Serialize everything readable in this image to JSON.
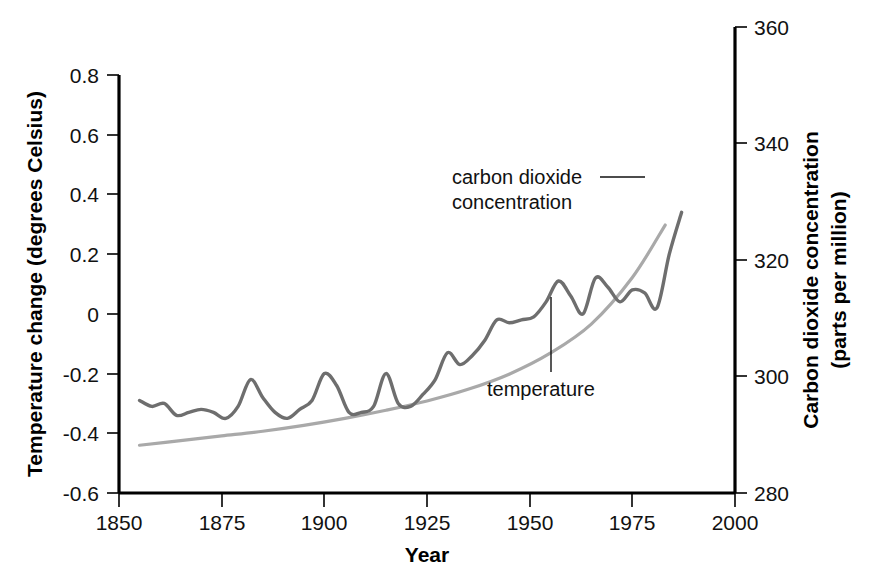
{
  "chart_data": {
    "type": "line",
    "title": "",
    "subtitle": "",
    "xlabel": "Year",
    "ylabel": "Temperature change (degrees Celsius)",
    "y2label": "Carbon dioxide concentration (parts per million)",
    "ylabel_line1": "Temperature change (degrees Celsius)",
    "y2label_line1": "Carbon dioxide concentration",
    "y2label_line2": "(parts per million)",
    "grid": false,
    "legend_position": "inline-annotations",
    "xlim": [
      1850,
      2000
    ],
    "ylim": [
      -0.6,
      0.8
    ],
    "y2lim": [
      280,
      360
    ],
    "xticks": [
      1850,
      1875,
      1900,
      1925,
      1950,
      1975,
      2000
    ],
    "xtick_labels": [
      "1850",
      "1875",
      "1900",
      "1925",
      "1950",
      "1975",
      "2000"
    ],
    "yticks": [
      -0.6,
      -0.4,
      -0.2,
      0,
      0.2,
      0.4,
      0.6,
      0.8
    ],
    "ytick_labels": [
      "-0.6",
      "-0.4",
      "-0.2",
      "0",
      "0.2",
      "0.4",
      "0.6",
      "0.8"
    ],
    "y2ticks": [
      280,
      300,
      320,
      340,
      360
    ],
    "y2tick_labels": [
      "280",
      "300",
      "320",
      "340",
      "360"
    ],
    "annotations": [
      {
        "id": "co2-annotation",
        "text_line1": "carbon dioxide",
        "text_line2": "concentration",
        "text": "carbon dioxide concentration",
        "x": 1889,
        "y": 0.46
      },
      {
        "id": "temperature-annotation",
        "text": "temperature",
        "x": 1937,
        "y": -0.24
      }
    ],
    "series": [
      {
        "name": "temperature",
        "axis": "left",
        "units": "degrees Celsius",
        "color": "#6e6e6e",
        "x": [
          1855,
          1858,
          1861,
          1864,
          1867,
          1870,
          1873,
          1876,
          1879,
          1882,
          1885,
          1888,
          1891,
          1894,
          1897,
          1900,
          1903,
          1906,
          1909,
          1912,
          1915,
          1918,
          1921,
          1924,
          1927,
          1930,
          1933,
          1936,
          1939,
          1942,
          1945,
          1948,
          1951,
          1954,
          1957,
          1960,
          1963,
          1966,
          1969,
          1972,
          1975,
          1978,
          1981,
          1984,
          1987
        ],
        "values": [
          -0.29,
          -0.31,
          -0.3,
          -0.34,
          -0.33,
          -0.32,
          -0.33,
          -0.35,
          -0.31,
          -0.22,
          -0.28,
          -0.33,
          -0.35,
          -0.32,
          -0.29,
          -0.2,
          -0.24,
          -0.33,
          -0.33,
          -0.31,
          -0.2,
          -0.3,
          -0.31,
          -0.27,
          -0.22,
          -0.13,
          -0.17,
          -0.14,
          -0.09,
          -0.02,
          -0.03,
          -0.02,
          -0.01,
          0.04,
          0.11,
          0.06,
          0.0,
          0.12,
          0.09,
          0.04,
          0.08,
          0.07,
          0.02,
          0.2,
          0.34
        ]
      },
      {
        "name": "carbon dioxide concentration",
        "axis": "right",
        "units": "parts per million",
        "color": "#a9a9a9",
        "x": [
          1855,
          1865,
          1875,
          1885,
          1895,
          1905,
          1915,
          1925,
          1935,
          1945,
          1955,
          1965,
          1975,
          1983
        ],
        "values": [
          288.2,
          289.0,
          289.8,
          290.6,
          291.6,
          292.8,
          294.2,
          295.8,
          297.8,
          300.4,
          304.0,
          309.0,
          317.0,
          326.0
        ]
      }
    ]
  }
}
